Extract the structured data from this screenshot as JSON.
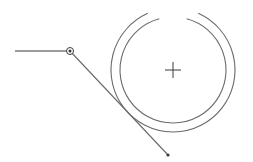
{
  "canvas": {
    "width": 253,
    "height": 162,
    "background": "#ffffff",
    "stroke_color": "#3a3a3a",
    "light_stroke_color": "#6a6a6a"
  },
  "drawing": {
    "center": {
      "x": 173,
      "y": 70
    },
    "outer_ring_radius": 62,
    "inner_ring_radius": 53,
    "ring_gap_top_deg": 30,
    "crosshair_size": 8,
    "leader_line": {
      "start": {
        "x": 15,
        "y": 51
      },
      "elbow": {
        "x": 70,
        "y": 51
      },
      "end": {
        "x": 168,
        "y": 155
      }
    },
    "elbow_handle_radius": 3.5,
    "end_dot_radius": 1.6
  }
}
